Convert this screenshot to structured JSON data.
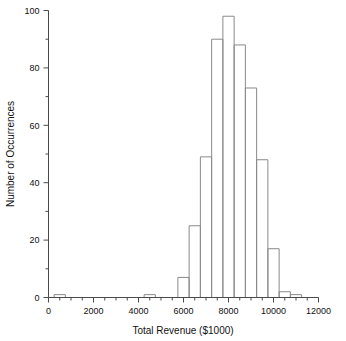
{
  "chart_data": {
    "type": "bar",
    "title": "",
    "subtitle": "",
    "xlabel": "Total Revenue  ($1000)",
    "ylabel": "Number of Occurrences",
    "xlim": [
      0,
      12000
    ],
    "ylim": [
      0,
      100
    ],
    "grid": false,
    "legend": null,
    "bin_width": 500,
    "x_major_ticks": [
      0,
      2000,
      4000,
      6000,
      8000,
      10000,
      12000
    ],
    "x_major_tick_labels": [
      "0",
      "2000",
      "4000",
      "6000",
      "8000",
      "10000",
      "12000"
    ],
    "x_minor_ticks": [
      500,
      1000,
      1500,
      2500,
      3000,
      3500,
      4500,
      5000,
      5500,
      6500,
      7000,
      7500,
      8500,
      9000,
      9500,
      10500,
      11000,
      11500
    ],
    "y_major_ticks": [
      0,
      20,
      40,
      60,
      80,
      100
    ],
    "y_major_tick_labels": [
      "0",
      "20",
      "40",
      "60",
      "80",
      "100"
    ],
    "y_minor_ticks": [
      10,
      30,
      50,
      70,
      90
    ],
    "bins": [
      {
        "x0": 250,
        "x1": 750,
        "value": 1
      },
      {
        "x0": 4250,
        "x1": 4750,
        "value": 1
      },
      {
        "x0": 5750,
        "x1": 6250,
        "value": 7
      },
      {
        "x0": 6250,
        "x1": 6750,
        "value": 25
      },
      {
        "x0": 6750,
        "x1": 7250,
        "value": 49
      },
      {
        "x0": 7250,
        "x1": 7750,
        "value": 90
      },
      {
        "x0": 7750,
        "x1": 8250,
        "value": 98
      },
      {
        "x0": 8250,
        "x1": 8750,
        "value": 88
      },
      {
        "x0": 8750,
        "x1": 9250,
        "value": 73
      },
      {
        "x0": 9250,
        "x1": 9750,
        "value": 48
      },
      {
        "x0": 9750,
        "x1": 10250,
        "value": 17
      },
      {
        "x0": 10250,
        "x1": 10750,
        "value": 2
      },
      {
        "x0": 10750,
        "x1": 11250,
        "value": 1
      }
    ],
    "categories": [
      "250-750",
      "4250-4750",
      "5750-6250",
      "6250-6750",
      "6750-7250",
      "7250-7750",
      "7750-8250",
      "8250-8750",
      "8750-9250",
      "9250-9750",
      "9750-10250",
      "10250-10750",
      "10750-11250"
    ],
    "values": [
      1,
      1,
      7,
      25,
      49,
      90,
      98,
      88,
      73,
      48,
      17,
      2,
      1
    ],
    "colors": {
      "background": "#ffffff",
      "axis": "#4a4a4a",
      "bar_stroke": "#8a8a8a",
      "bar_fill": "#ffffff",
      "text": "#111111"
    }
  }
}
